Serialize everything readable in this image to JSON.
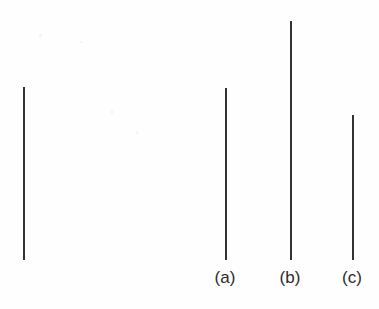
{
  "figure": {
    "type": "line-length-comparison-stimulus",
    "background_color": "#fefefe",
    "line_color": "#333333",
    "label_color": "#2b2b2b",
    "width": 379,
    "height": 309,
    "baseline_y": 260
  },
  "reference": {
    "name": "reference-line",
    "label": "",
    "x": 23,
    "top": 87,
    "bottom": 260,
    "length_px": 173
  },
  "comparisons": [
    {
      "id": "a",
      "label": "(a)",
      "x": 225,
      "top": 88,
      "bottom": 260,
      "length_px": 172,
      "label_x": 205,
      "label_y": 269
    },
    {
      "id": "b",
      "label": "(b)",
      "x": 290,
      "top": 21,
      "bottom": 260,
      "length_px": 239,
      "label_x": 270,
      "label_y": 269
    },
    {
      "id": "c",
      "label": "(c)",
      "x": 352,
      "top": 115,
      "bottom": 260,
      "length_px": 145,
      "label_x": 332,
      "label_y": 269
    }
  ],
  "chart_data": {
    "type": "bar",
    "orientation": "vertical",
    "title": "",
    "subtitle": "",
    "xlabel": "",
    "ylabel": "",
    "categories": [
      "reference",
      "(a)",
      "(b)",
      "(c)"
    ],
    "values": [
      173,
      172,
      239,
      145
    ],
    "value_unit": "px",
    "tick_labels": [
      "",
      "(a)",
      "(b)",
      "(c)"
    ],
    "legend": [],
    "legend_position": "none",
    "grid": false,
    "axis_visible": false,
    "ylim": [
      0,
      239
    ]
  }
}
